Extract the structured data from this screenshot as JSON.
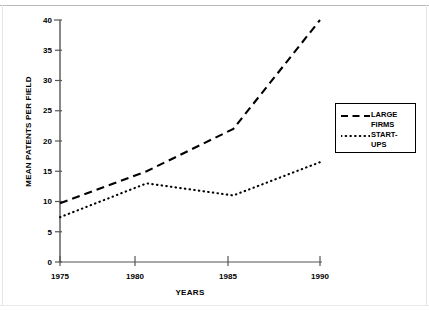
{
  "chart_data": {
    "type": "line",
    "title": "",
    "xlabel": "YEARS",
    "ylabel": "MEAN PATENTS PER FIELD",
    "x": [
      1975,
      1980,
      1985,
      1990
    ],
    "xtick_labels": [
      "1975",
      "1980",
      "1985",
      "1990"
    ],
    "ytick_labels": [
      "0",
      "5",
      "10",
      "15",
      "20",
      "25",
      "30",
      "35",
      "40"
    ],
    "ytick_values": [
      0,
      5,
      10,
      15,
      20,
      25,
      30,
      35,
      40
    ],
    "xlim": [
      1975,
      1990
    ],
    "ylim": [
      0,
      40
    ],
    "grid": false,
    "legend_position": "right",
    "series": [
      {
        "name": "LARGE FIRMS",
        "label_lines": [
          "LARGE",
          "FIRMS"
        ],
        "style": "dashed",
        "color": "#000000",
        "values": [
          9.7,
          15.0,
          22.0,
          40.0
        ]
      },
      {
        "name": "START-UPS",
        "label_lines": [
          "START-",
          "UPS"
        ],
        "style": "dotted",
        "color": "#000000",
        "values": [
          7.4,
          13.0,
          11.0,
          16.5
        ]
      }
    ]
  },
  "axes": {
    "y_label": "MEAN PATENTS PER FIELD",
    "x_label": "YEARS",
    "y_ticks": [
      "40",
      "35",
      "30",
      "25",
      "20",
      "15",
      "10",
      "5",
      "0"
    ],
    "x_ticks": [
      "1975",
      "1980",
      "1985",
      "1990"
    ]
  },
  "legend": {
    "items": [
      {
        "line1": "LARGE",
        "line2": "FIRMS",
        "style": "dashed"
      },
      {
        "line1": "START-",
        "line2": "UPS",
        "style": "dotted"
      }
    ]
  }
}
